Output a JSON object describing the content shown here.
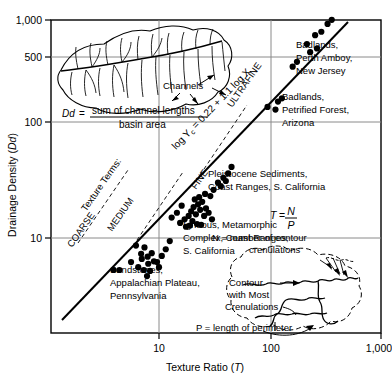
{
  "chart_data": {
    "type": "scatter",
    "title": "",
    "xlabel": "Texture Ratio (T)",
    "ylabel": "Drainage Density (Dd)",
    "xscale": "log",
    "yscale": "log",
    "xlim": [
      3.2,
      1000
    ],
    "ylim": [
      4.0,
      1000
    ],
    "xticks": [
      10,
      100,
      1000
    ],
    "xticklabels": [
      "10",
      "100",
      "1,000"
    ],
    "yticks": [
      10,
      100,
      500,
      1000
    ],
    "yticklabels": [
      "10",
      "100",
      "500",
      "1,000"
    ],
    "grid": true,
    "legend_position": "none",
    "fit_line": {
      "equation": "log Y c = 0.22 + 1.1 log X",
      "intercept": 0.22,
      "slope": 1.1,
      "x_start": 3.6,
      "x_end": 420
    },
    "series": [
      {
        "name": "Sandstones, Appalachian Plateau, Pennsylvania",
        "points": [
          [
            3.9,
            5.3
          ],
          [
            4.4,
            5.3
          ],
          [
            6.2,
            8.6
          ],
          [
            6.9,
            7.3
          ],
          [
            7.4,
            8.3
          ],
          [
            7.0,
            6.6
          ],
          [
            7.9,
            6.9
          ],
          [
            8.6,
            7.4
          ],
          [
            8.0,
            6.0
          ],
          [
            9.0,
            6.3
          ],
          [
            6.5,
            5.6
          ],
          [
            7.3,
            5.3
          ],
          [
            8.3,
            5.2
          ],
          [
            9.6,
            6.2
          ],
          [
            10.6,
            7.0
          ],
          [
            7.8,
            4.7
          ],
          [
            10.0,
            5.6
          ],
          [
            11.5,
            8.0
          ],
          [
            5.6,
            6.2
          ],
          [
            12.5,
            9.4
          ]
        ]
      },
      {
        "name": "Igneous, Metamorphic Complex, Coast Ranges, S. California",
        "points": [
          [
            15.5,
            13.5
          ],
          [
            17.0,
            14.5
          ],
          [
            18.5,
            15.5
          ],
          [
            19.5,
            17.0
          ],
          [
            20.5,
            18.5
          ],
          [
            21.5,
            16.0
          ],
          [
            22.5,
            19.5
          ],
          [
            20.0,
            14.0
          ],
          [
            23.5,
            17.5
          ],
          [
            24.5,
            20.5
          ],
          [
            25.5,
            15.5
          ],
          [
            26.5,
            18.0
          ],
          [
            17.5,
            12.5
          ],
          [
            19.0,
            12.8
          ],
          [
            22.0,
            13.2
          ],
          [
            14.5,
            16.5
          ],
          [
            13.0,
            15.0
          ],
          [
            28.0,
            16.5
          ],
          [
            30.0,
            14.5
          ],
          [
            24.0,
            13.0
          ],
          [
            21.0,
            21.5
          ],
          [
            23.0,
            22.5
          ],
          [
            26.0,
            24.0
          ],
          [
            16.0,
            19.0
          ]
        ]
      },
      {
        "name": "Pleistocene Sediments, Coast Ranges, S. California",
        "points": [
          [
            31.0,
            26.0
          ],
          [
            34.0,
            30.0
          ],
          [
            38.0,
            33.0
          ],
          [
            42.0,
            36.0
          ],
          [
            36.0,
            28.0
          ],
          [
            45.0,
            41.0
          ],
          [
            29.0,
            23.0
          ],
          [
            40.0,
            31.0
          ]
        ]
      },
      {
        "name": "Badlands, Petrified Forest, Arizona",
        "points": [
          [
            95.0,
            135.0
          ],
          [
            118.0,
            150.0
          ],
          [
            128.0,
            160.0
          ],
          [
            112.0,
            128.0
          ]
        ]
      },
      {
        "name": "Badlands, Perth Amboy, New Jersey",
        "points": [
          [
            175.0,
            330.0
          ],
          [
            215.0,
            470.0
          ],
          [
            255.0,
            560.0
          ],
          [
            290.0,
            600.0
          ],
          [
            230.0,
            400.0
          ],
          [
            265.0,
            430.0
          ],
          [
            330.0,
            700.0
          ],
          [
            360.0,
            760.0
          ],
          [
            160.0,
            300.0
          ]
        ]
      }
    ],
    "annotations": [
      {
        "name": "texture-terms",
        "text": "Texture Terms:"
      },
      {
        "name": "coarse",
        "text": "COARSE"
      },
      {
        "name": "medium",
        "text": "MEDIUM"
      },
      {
        "name": "fine",
        "text": "FINE"
      },
      {
        "name": "ultrafine",
        "text": "ULTRAFINE"
      }
    ]
  },
  "axes": {
    "x_label": "Texture Ratio (T)",
    "x_label_italic": "T",
    "y_label": "Drainage Density (Dd)",
    "y_label_italic": "Dd",
    "x_tick_1": "10",
    "x_tick_2": "100",
    "x_tick_3": "1,000",
    "y_tick_1": "10",
    "y_tick_2": "100",
    "y_tick_3": "500",
    "y_tick_4": "1,000"
  },
  "texture_terms": {
    "heading": "Texture Terms:",
    "coarse": "COARSE",
    "medium": "MEDIUM",
    "fine": "FINE",
    "ultrafine": "ULTRAFINE"
  },
  "fit": {
    "equation_prefix": "log Y",
    "equation_sub": "c",
    "equation_rest": "= 0.22 + 1.1 log X"
  },
  "callouts": {
    "badlands_nj_l1": "Badlands,",
    "badlands_nj_l2": "Perth Amboy,",
    "badlands_nj_l3": "New Jersey",
    "badlands_az_l1": "Badlands,",
    "badlands_az_l2": "Petrified Forest,",
    "badlands_az_l3": "Arizona",
    "pleistocene_l1": "Pleistocene Sediments,",
    "pleistocene_l2": "Coast Ranges, S. California",
    "igneous_l1": "Igneous, Metamorphic",
    "igneous_l2": "Complex, Coast Ranges,",
    "igneous_l3": "S. California",
    "sandstones_l1": "Sandstones,",
    "sandstones_l2": "Appalachian Plateau,",
    "sandstones_l3": "Pennsylvania"
  },
  "basin_inset": {
    "channels_label": "Channels",
    "formula_lhs": "Dd",
    "formula_eq": "=",
    "formula_numerator": "sum of channel lengths",
    "formula_denominator": "basin area"
  },
  "contour_inset": {
    "formula_t": "T",
    "formula_eq": "=",
    "formula_n": "N",
    "formula_p": "P",
    "n_definition_l1": "N = number of contour",
    "n_definition_l2": "crenulations",
    "p_definition": "P = length of perimeter",
    "contour_label_l1": "Contour",
    "contour_label_l2": "with Most",
    "contour_label_l3": "Crenulations"
  },
  "colors": {
    "ink": "#000000",
    "grid": "#808080",
    "frame": "#000000",
    "point": "#000000"
  }
}
